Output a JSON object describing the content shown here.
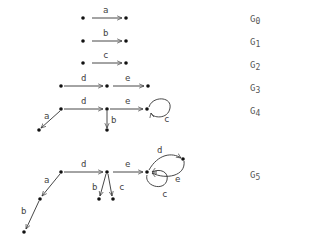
{
  "graphs": [
    {
      "id": "G0",
      "name": "G",
      "sub": "0",
      "label_pos": [
        250,
        14
      ],
      "nodes": [
        [
          83,
          18
        ],
        [
          126,
          18
        ]
      ],
      "edges": [
        {
          "label": "a",
          "from": [
            92,
            18
          ],
          "to": [
            122,
            18
          ],
          "lx": 103,
          "ly": 13
        }
      ]
    },
    {
      "id": "G1",
      "name": "G",
      "sub": "1",
      "label_pos": [
        250,
        37
      ],
      "nodes": [
        [
          83,
          41
        ],
        [
          126,
          41
        ]
      ],
      "edges": [
        {
          "label": "b",
          "from": [
            92,
            41
          ],
          "to": [
            122,
            41
          ],
          "lx": 103,
          "ly": 36
        }
      ]
    },
    {
      "id": "G2",
      "name": "G",
      "sub": "2",
      "label_pos": [
        250,
        60
      ],
      "nodes": [
        [
          83,
          63
        ],
        [
          126,
          63
        ]
      ],
      "edges": [
        {
          "label": "c",
          "from": [
            92,
            63
          ],
          "to": [
            122,
            63
          ],
          "lx": 103,
          "ly": 58
        }
      ]
    },
    {
      "id": "G3",
      "name": "G",
      "sub": "3",
      "label_pos": [
        250,
        83
      ],
      "nodes": [
        [
          61,
          86
        ],
        [
          107,
          86
        ],
        [
          148,
          86
        ]
      ],
      "edges": [
        {
          "label": "d",
          "from": [
            64,
            86
          ],
          "to": [
            103,
            86
          ],
          "lx": 81,
          "ly": 81
        },
        {
          "label": "e",
          "from": [
            113,
            86
          ],
          "to": [
            144,
            86
          ],
          "lx": 125,
          "ly": 81
        }
      ]
    },
    {
      "id": "G4",
      "name": "G",
      "sub": "4",
      "label_pos": [
        250,
        106
      ],
      "nodes": [
        [
          61,
          109
        ],
        [
          107,
          109
        ],
        [
          147,
          109
        ],
        [
          39,
          130
        ],
        [
          107,
          130
        ]
      ],
      "edges": [
        {
          "label": "d",
          "from": [
            64,
            109
          ],
          "to": [
            103,
            109
          ],
          "lx": 81,
          "ly": 104
        },
        {
          "label": "e",
          "from": [
            110,
            109
          ],
          "to": [
            143,
            109
          ],
          "lx": 125,
          "ly": 104
        },
        {
          "label": "a",
          "from": [
            60,
            111
          ],
          "to": [
            41,
            128
          ],
          "lx": 44,
          "ly": 119
        },
        {
          "label": "b",
          "from": [
            107,
            111
          ],
          "to": [
            107,
            128
          ],
          "lx": 111,
          "ly": 123
        }
      ],
      "loops": [
        {
          "label": "c",
          "d": "M149,107 C152,96 172,96 170,108 C168,120 152,118 151,113",
          "lx": 164,
          "ly": 122
        }
      ]
    },
    {
      "id": "G5",
      "name": "G",
      "sub": "5",
      "label_pos": [
        250,
        170
      ],
      "nodes": [
        [
          61,
          172
        ],
        [
          40,
          199
        ],
        [
          24,
          232
        ],
        [
          107,
          172
        ],
        [
          99,
          199
        ],
        [
          113,
          199
        ],
        [
          147,
          172
        ],
        [
          183,
          159
        ]
      ],
      "edges": [
        {
          "label": "d",
          "from": [
            64,
            172
          ],
          "to": [
            103,
            172
          ],
          "lx": 81,
          "ly": 167
        },
        {
          "label": "e",
          "from": [
            113,
            172
          ],
          "to": [
            143,
            172
          ],
          "lx": 125,
          "ly": 167
        },
        {
          "label": "a",
          "from": [
            60,
            174
          ],
          "to": [
            42,
            196
          ],
          "lx": 44,
          "ly": 183
        },
        {
          "label": "b",
          "from": [
            39,
            201
          ],
          "to": [
            26,
            229
          ],
          "lx": 21,
          "ly": 214
        },
        {
          "label": "b",
          "from": [
            106,
            174
          ],
          "to": [
            100,
            196
          ],
          "lx": 92,
          "ly": 190
        },
        {
          "label": "c",
          "from": [
            108,
            174
          ],
          "to": [
            112,
            196
          ],
          "lx": 119,
          "ly": 190
        }
      ],
      "curves": [
        {
          "label": "d",
          "d": "M149,170 C158,154 172,152 181,158",
          "lx": 157,
          "ly": 153
        },
        {
          "label": "e",
          "d": "M184,161 C186,176 166,180 152,173",
          "lx": 175,
          "ly": 182
        },
        {
          "label": "c",
          "d": "M147,175 C144,186 164,192 167,180 C169,172 160,168 152,172",
          "lx": 162,
          "ly": 197
        }
      ]
    }
  ]
}
